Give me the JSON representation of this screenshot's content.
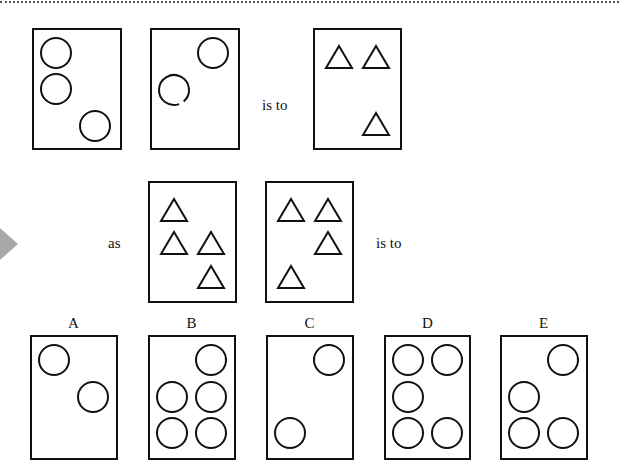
{
  "puzzle": {
    "connectors": {
      "is_to_1": "is to",
      "as": "as",
      "is_to_2": "is to"
    },
    "row1": [
      {
        "id": "p1",
        "shapes": [
          {
            "type": "circle",
            "cx": 22,
            "cy": 23
          },
          {
            "type": "circle",
            "cx": 22,
            "cy": 59
          },
          {
            "type": "circle",
            "cx": 61,
            "cy": 96
          }
        ]
      },
      {
        "id": "p2",
        "shapes": [
          {
            "type": "circle",
            "cx": 61,
            "cy": 23
          },
          {
            "type": "broken-circle",
            "cx": 22,
            "cy": 60
          }
        ]
      },
      {
        "id": "p3",
        "shapes": [
          {
            "type": "triangle",
            "cx": 24,
            "cy": 27
          },
          {
            "type": "triangle",
            "cx": 61,
            "cy": 27
          },
          {
            "type": "triangle",
            "cx": 61,
            "cy": 94
          }
        ]
      }
    ],
    "row2": [
      {
        "id": "p4",
        "shapes": [
          {
            "type": "triangle",
            "cx": 24,
            "cy": 27
          },
          {
            "type": "triangle",
            "cx": 24,
            "cy": 60
          },
          {
            "type": "triangle",
            "cx": 61,
            "cy": 60
          },
          {
            "type": "triangle",
            "cx": 61,
            "cy": 94
          }
        ]
      },
      {
        "id": "p5",
        "shapes": [
          {
            "type": "triangle",
            "cx": 24,
            "cy": 27
          },
          {
            "type": "triangle",
            "cx": 61,
            "cy": 27
          },
          {
            "type": "triangle",
            "cx": 61,
            "cy": 60
          },
          {
            "type": "triangle",
            "cx": 24,
            "cy": 94
          }
        ]
      }
    ],
    "options": [
      {
        "label": "A",
        "shapes": [
          {
            "type": "circle",
            "cx": 22,
            "cy": 23
          },
          {
            "type": "circle",
            "cx": 61,
            "cy": 60
          }
        ]
      },
      {
        "label": "B",
        "shapes": [
          {
            "type": "circle",
            "cx": 61,
            "cy": 23
          },
          {
            "type": "circle",
            "cx": 22,
            "cy": 60
          },
          {
            "type": "circle",
            "cx": 61,
            "cy": 60
          },
          {
            "type": "circle",
            "cx": 22,
            "cy": 96
          },
          {
            "type": "circle",
            "cx": 61,
            "cy": 96
          }
        ]
      },
      {
        "label": "C",
        "shapes": [
          {
            "type": "circle",
            "cx": 61,
            "cy": 23
          },
          {
            "type": "circle",
            "cx": 22,
            "cy": 96
          }
        ]
      },
      {
        "label": "D",
        "shapes": [
          {
            "type": "circle",
            "cx": 22,
            "cy": 23
          },
          {
            "type": "circle",
            "cx": 61,
            "cy": 23
          },
          {
            "type": "circle",
            "cx": 22,
            "cy": 60
          },
          {
            "type": "circle",
            "cx": 22,
            "cy": 96
          },
          {
            "type": "circle",
            "cx": 61,
            "cy": 96
          }
        ]
      },
      {
        "label": "E",
        "shapes": [
          {
            "type": "circle",
            "cx": 61,
            "cy": 23
          },
          {
            "type": "circle",
            "cx": 22,
            "cy": 60
          },
          {
            "type": "circle",
            "cx": 22,
            "cy": 96
          },
          {
            "type": "circle",
            "cx": 61,
            "cy": 96
          }
        ]
      }
    ]
  },
  "colors": {
    "ink": "#111111",
    "arrow": "#a9a9a9",
    "background": "#ffffff"
  }
}
